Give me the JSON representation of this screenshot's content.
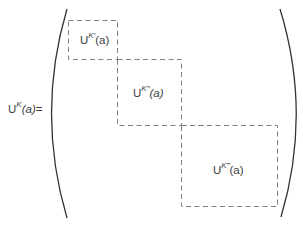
{
  "equation": {
    "lhs": {
      "base": "U",
      "superscript": "K",
      "argument": "(a)",
      "equals": "="
    },
    "blocks": [
      {
        "base": "U",
        "superscript": "K′",
        "argument": "(a)"
      },
      {
        "base": "U",
        "superscript": "K″",
        "argument": "(a)"
      },
      {
        "base": "U",
        "superscript": "K‴",
        "argument": "(a)"
      }
    ]
  },
  "colors": {
    "paren": "#333333",
    "dash": "#777777",
    "text": "#3d3d3d"
  }
}
